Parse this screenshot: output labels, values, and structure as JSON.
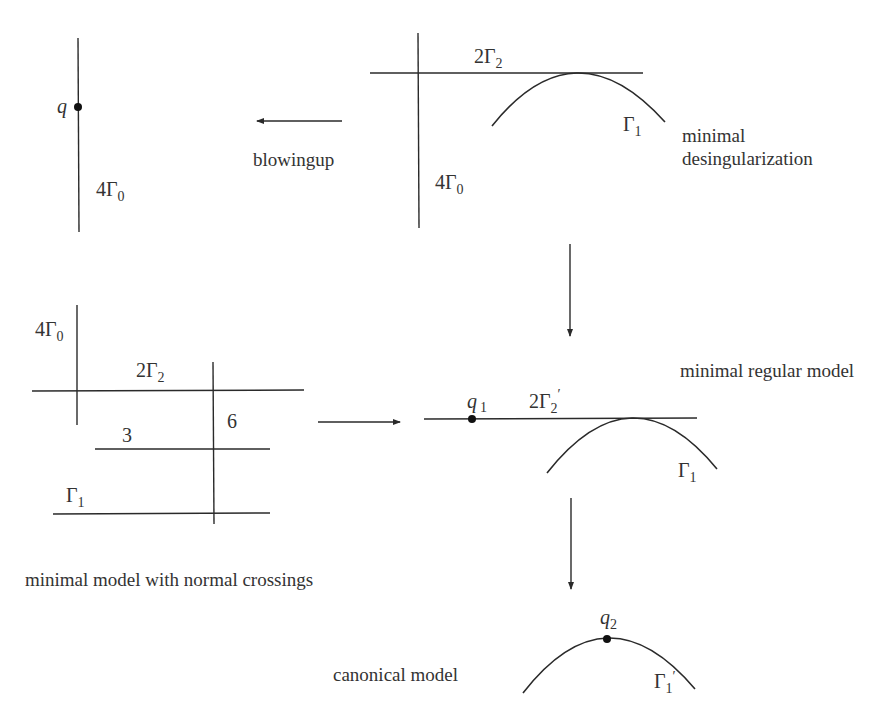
{
  "figure": {
    "panels": {
      "original": {
        "point_label": "q",
        "curve_label": "4Γ",
        "curve_sub": "0"
      },
      "blowup_arrow": {
        "label": "blowingup"
      },
      "minimal_desingularization": {
        "caption_line1": "minimal",
        "caption_line2": "desingularization",
        "vertical_label": "4Γ",
        "vertical_sub": "0",
        "horizontal_label": "2Γ",
        "horizontal_sub": "2",
        "arc_label": "Γ",
        "arc_sub": "1"
      },
      "normal_crossings": {
        "caption": "minimal model with normal crossings",
        "vertical_label": "4Γ",
        "vertical_sub": "0",
        "horizontal_label": "2Γ",
        "horizontal_sub": "2",
        "mult_vertical": "6",
        "mult_middle": "3",
        "bottom_label": "Γ",
        "bottom_sub": "1"
      },
      "minimal_regular": {
        "caption": "minimal regular model",
        "point_label": "q",
        "point_sub": "1",
        "line_label": "2Γ",
        "line_sub": "2",
        "line_prime": "′",
        "arc_label": "Γ",
        "arc_sub": "1"
      },
      "canonical": {
        "caption": "canonical model",
        "point_label": "q",
        "point_sub": "2",
        "arc_label": "Γ",
        "arc_sub": "1",
        "arc_prime": "′"
      }
    },
    "colors": {
      "ink": "#2a2a2a",
      "text": "#333333",
      "background": "#ffffff"
    }
  }
}
